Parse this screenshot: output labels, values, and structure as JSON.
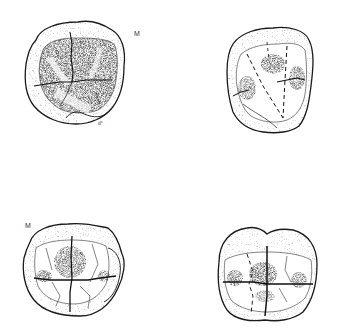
{
  "figure": {
    "background_color": "#ffffff",
    "ink_color": "#1a1a1a",
    "panels": [
      {
        "id": "top-left",
        "label": "M",
        "annotation": "d°"
      },
      {
        "id": "top-right",
        "label": ""
      },
      {
        "id": "bottom-left",
        "label": "M"
      },
      {
        "id": "bottom-right",
        "label": ""
      }
    ]
  }
}
